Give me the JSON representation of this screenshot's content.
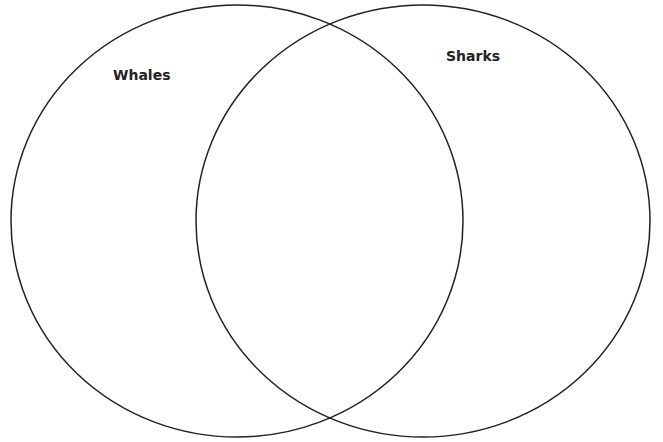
{
  "diagram": {
    "type": "venn",
    "sets": [
      {
        "label": "Whales",
        "cx": 237,
        "cy": 221,
        "rx": 226,
        "ry": 216
      },
      {
        "label": "Sharks",
        "cx": 423,
        "cy": 221,
        "rx": 227,
        "ry": 216
      }
    ],
    "stroke_color": "#222222",
    "background": "#ffffff"
  }
}
